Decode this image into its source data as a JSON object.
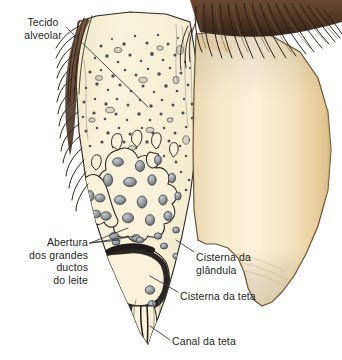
{
  "figure": {
    "background_color": "#ffffff"
  },
  "labels": [
    {
      "id": "tecido-alveolar",
      "text": "Tecido\nalveolar",
      "align": "center",
      "points_to": "alveolar-tissue-region"
    },
    {
      "id": "abertura",
      "text": "Abertura\ndos grandes\nductos\ndo leite",
      "align": "right",
      "points_to": "large-milk-duct-openings"
    },
    {
      "id": "cisterna-glandula",
      "text": "Cisterna da\nglândula",
      "align": "left",
      "points_to": "gland-cistern"
    },
    {
      "id": "cisterna-teta",
      "text": "Cisterna da teta",
      "align": "left",
      "points_to": "teat-cistern"
    },
    {
      "id": "canal-teta",
      "text": "Canal da teta",
      "align": "left",
      "points_to": "teat-canal"
    }
  ],
  "colors": {
    "text": "#231f20",
    "leader_line": "#3a3a3a",
    "cut_surface": "#f7f2d9",
    "cut_surface_outline": "#2a2622",
    "teat_exterior_light": "#f8ecd2",
    "teat_exterior_mid": "#f0ddb4",
    "teat_exterior_shadow": "#e2c793",
    "teat_outline": "#6b5330",
    "hair_dark": "#3c2a1d",
    "hair_mid": "#6b4a33",
    "hair_light": "#8a6b4c",
    "duct_fill": "#9aa0a4",
    "duct_dark": "#4a4f53",
    "cistern_dark": "#332f2c",
    "background": "#ffffff"
  }
}
